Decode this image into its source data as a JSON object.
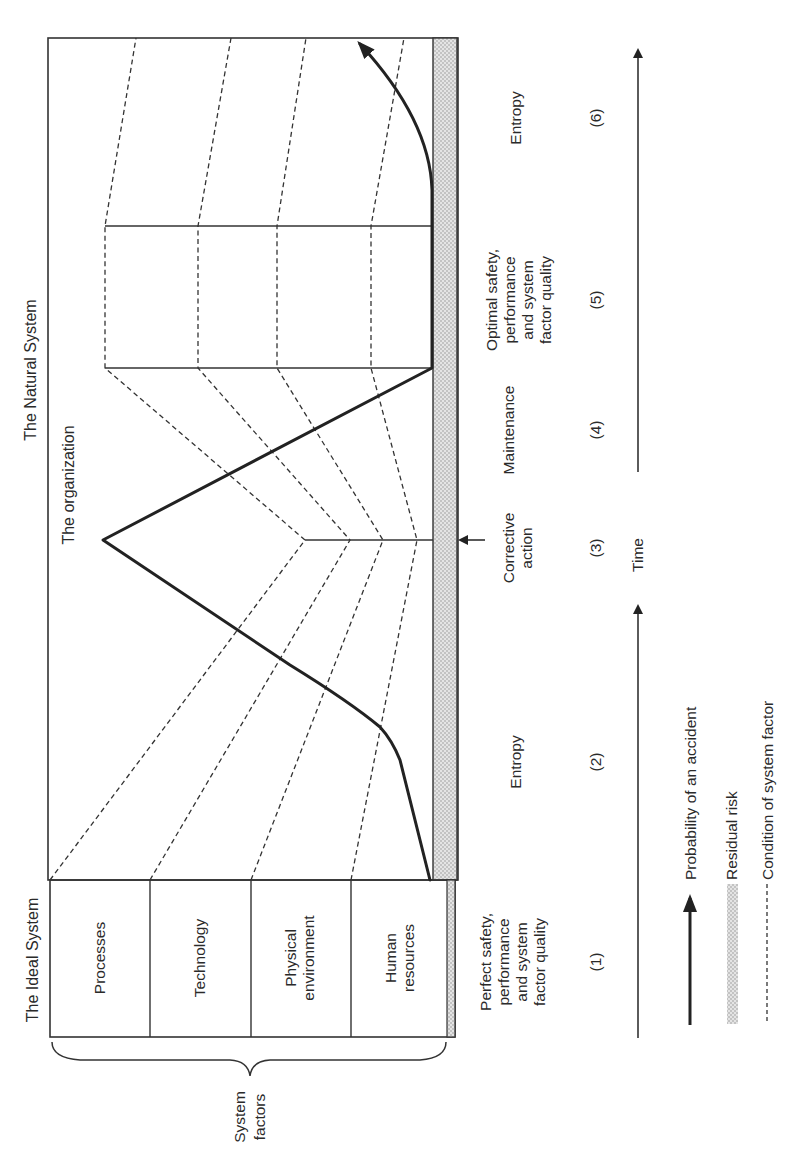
{
  "diagram": {
    "orientation": "rotated 90 degrees counter-clockwise",
    "titles": {
      "natural_system": "The Natural System",
      "organization": "The organization",
      "ideal_system": "The Ideal System"
    },
    "system_factors": {
      "brace_label_line1": "System",
      "brace_label_line2": "factors",
      "items": [
        {
          "line1": "Processes",
          "line2": ""
        },
        {
          "line1": "Technology",
          "line2": ""
        },
        {
          "line1": "Physical",
          "line2": "environment"
        },
        {
          "line1": "Human",
          "line2": "resources"
        }
      ]
    },
    "phases": [
      {
        "number": "(1)",
        "lines": [
          "Perfect safety,",
          "performance",
          "and system",
          "factor quality"
        ]
      },
      {
        "number": "(2)",
        "lines": [
          "Entropy"
        ]
      },
      {
        "number": "(3)",
        "lines": [
          "Corrective",
          "action"
        ]
      },
      {
        "number": "(4)",
        "lines": [
          "Maintenance"
        ]
      },
      {
        "number": "(5)",
        "lines": [
          "Optimal safety,",
          "performance",
          "and system",
          "factor quality"
        ]
      },
      {
        "number": "(6)",
        "lines": [
          "Entropy"
        ]
      }
    ],
    "time_axis": {
      "label": "Time"
    },
    "legend": [
      {
        "symbol": "solid-arrow",
        "label": "Probability of an accident"
      },
      {
        "symbol": "shaded-band",
        "label": "Residual risk"
      },
      {
        "symbol": "dashed-line",
        "label": "Condition of system factor"
      }
    ],
    "colors": {
      "line": "#333333",
      "accident_line": "#222222",
      "residual_band": "#c8c8c8",
      "background": "#ffffff"
    }
  }
}
